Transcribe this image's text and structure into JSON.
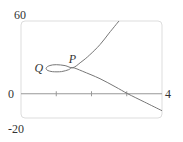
{
  "chart_data": {
    "type": "line",
    "title": "",
    "xlabel": "",
    "ylabel": "",
    "xlim": [
      0,
      4
    ],
    "ylim": [
      -20,
      60
    ],
    "x_ticks": [
      1,
      2,
      3
    ],
    "axis_labels": {
      "y_top": "60",
      "y_bottom": "-20",
      "x_origin": "0",
      "x_right": "4"
    },
    "grid": false,
    "legend": "none",
    "series": [
      {
        "name": "parametric-curve",
        "points": [
          [
            2.78,
            60
          ],
          [
            2.5,
            50
          ],
          [
            2.24,
            40.5
          ],
          [
            1.95,
            32
          ],
          [
            1.7,
            26
          ],
          [
            1.47,
            21.5
          ],
          [
            1.25,
            23.2
          ],
          [
            1.0,
            24
          ],
          [
            0.82,
            23.3
          ],
          [
            0.72,
            21.5
          ],
          [
            0.74,
            19.5
          ],
          [
            0.9,
            18.2
          ],
          [
            1.15,
            18.3
          ],
          [
            1.35,
            19.8
          ],
          [
            1.47,
            21.5
          ],
          [
            1.75,
            18.5
          ],
          [
            2.24,
            12.4
          ],
          [
            2.67,
            5.8
          ],
          [
            3.03,
            0
          ],
          [
            3.5,
            -6.8
          ],
          [
            4.0,
            -14
          ]
        ]
      }
    ],
    "annotations": [
      {
        "text": "P",
        "x": 1.47,
        "y": 21.5,
        "position": "above"
      },
      {
        "text": "Q",
        "x": 0.72,
        "y": 21.5,
        "position": "left"
      }
    ]
  },
  "colors": {
    "curve": "#777777",
    "axis": "#999999",
    "frame": "#dddddd",
    "text": "#333333"
  }
}
